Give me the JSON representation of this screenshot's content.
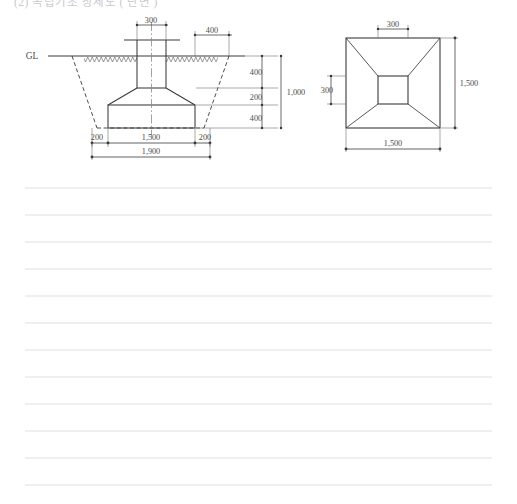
{
  "page": {
    "background_color": "#ffffff",
    "line_color": "#3a3a3a",
    "rule_color": "#dcdce2",
    "header_partial_text": "(2)  독립기초  상세도  ( 단면 )"
  },
  "section_view": {
    "name": "foundation-section-view",
    "ground_level_label": "GL",
    "dimensions": {
      "column_width": "300",
      "column_offset_right": "400",
      "depth_upper": "400",
      "depth_middle": "200",
      "depth_lower": "400",
      "depth_total": "1,000",
      "base_left_projection": "200",
      "base_width": "1,500",
      "base_right_projection": "200",
      "excavation_width": "1,900"
    }
  },
  "plan_view": {
    "name": "foundation-plan-view",
    "dimensions": {
      "inner_square_top": "300",
      "inner_square_left": "300",
      "outer_square_right": "1,500",
      "outer_square_bottom": "1,500"
    }
  },
  "notes_area": {
    "name": "ruled-note-lines",
    "line_count": 12,
    "first_line_y": 188,
    "line_spacing": 27,
    "line_left": 25,
    "line_right": 492
  },
  "chart_data": {
    "type": "table",
    "views": [
      {
        "view": "section",
        "labels": [
          "GL"
        ],
        "dimensions": [
          {
            "label": "300",
            "meaning": "column width",
            "orientation": "horizontal"
          },
          {
            "label": "400",
            "meaning": "offset from centerline to excavation edge at top",
            "orientation": "horizontal"
          },
          {
            "label": "400",
            "meaning": "upper depth from GL to top of taper",
            "orientation": "vertical"
          },
          {
            "label": "200",
            "meaning": "tapered haunch height",
            "orientation": "vertical"
          },
          {
            "label": "400",
            "meaning": "base pad thickness",
            "orientation": "vertical"
          },
          {
            "label": "1,000",
            "meaning": "total depth below GL",
            "orientation": "vertical"
          },
          {
            "label": "200",
            "meaning": "left working space",
            "orientation": "horizontal"
          },
          {
            "label": "1,500",
            "meaning": "footing base width",
            "orientation": "horizontal"
          },
          {
            "label": "200",
            "meaning": "right working space",
            "orientation": "horizontal"
          },
          {
            "label": "1,900",
            "meaning": "total excavation width",
            "orientation": "horizontal"
          }
        ]
      },
      {
        "view": "plan",
        "labels": [],
        "dimensions": [
          {
            "label": "300",
            "meaning": "inner square width",
            "orientation": "horizontal"
          },
          {
            "label": "300",
            "meaning": "inner square height",
            "orientation": "vertical"
          },
          {
            "label": "1,500",
            "meaning": "outer square height",
            "orientation": "vertical"
          },
          {
            "label": "1,500",
            "meaning": "outer square width",
            "orientation": "horizontal"
          }
        ]
      }
    ]
  }
}
